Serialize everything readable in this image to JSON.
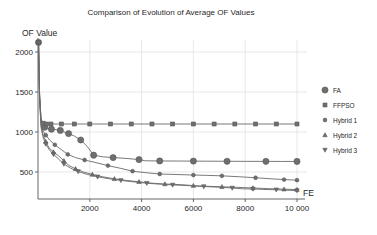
{
  "chart_data": {
    "type": "line",
    "title": "Comparison of Evolution of Average OF Values",
    "xlabel": "FE",
    "ylabel": "OF Value",
    "xlim": [
      0,
      10400
    ],
    "ylim": [
      160,
      2200
    ],
    "grid": true,
    "legend_position": "right",
    "xticks": [
      2000,
      4000,
      6000,
      8000,
      10000
    ],
    "xtick_labels": [
      "2000",
      "4000",
      "6000",
      "8000",
      "10 000"
    ],
    "yticks": [
      500,
      1000,
      1500,
      2000
    ],
    "ytick_labels": [
      "500",
      "1000",
      "1500",
      "2000"
    ],
    "series": [
      {
        "name": "FA",
        "marker": "circle-filled",
        "marker_size": 3.1,
        "color": "#6e6e6e",
        "x": [
          20,
          60,
          110,
          180,
          260,
          380,
          520,
          700,
          860,
          1000,
          1180,
          1400,
          1650,
          1900,
          2150,
          2500,
          2900,
          3400,
          3900,
          4150,
          4700,
          5400,
          6000,
          6500,
          7300,
          8000,
          8800,
          9400,
          10000
        ],
        "y": [
          2120,
          1500,
          1180,
          1090,
          1060,
          1045,
          1035,
          1030,
          1020,
          1000,
          980,
          950,
          900,
          820,
          710,
          690,
          680,
          670,
          655,
          640,
          638,
          637,
          636,
          635,
          634,
          633,
          633,
          632,
          632
        ]
      },
      {
        "name": "FFPSO",
        "marker": "square",
        "marker_size": 2.0,
        "color": "#8a8a8a",
        "x": [
          20,
          60,
          120,
          200,
          320,
          500,
          900,
          1400,
          2000,
          2800,
          3600,
          4400,
          5200,
          6000,
          6800,
          7600,
          8400,
          9200,
          10000
        ],
        "y": [
          2120,
          1480,
          1160,
          1110,
          1100,
          1100,
          1100,
          1100,
          1100,
          1100,
          1100,
          1100,
          1100,
          1100,
          1100,
          1100,
          1100,
          1100,
          1100
        ]
      },
      {
        "name": "Hybrid 1",
        "marker": "circle-small",
        "marker_size": 1.9,
        "color": "#7a7a7a",
        "x": [
          20,
          60,
          120,
          200,
          300,
          450,
          650,
          900,
          1150,
          1450,
          1800,
          2200,
          2700,
          3200,
          3650,
          4200,
          4700,
          5400,
          6000,
          6500,
          7100,
          7800,
          8400,
          9000,
          9500,
          10000
        ],
        "y": [
          2120,
          1450,
          1120,
          1010,
          960,
          900,
          840,
          780,
          720,
          680,
          650,
          620,
          580,
          545,
          510,
          490,
          475,
          468,
          462,
          458,
          452,
          440,
          428,
          415,
          405,
          398
        ]
      },
      {
        "name": "Hybrid 2",
        "marker": "triangle-up",
        "marker_size": 2.2,
        "color": "#6f6f6f",
        "x": [
          20,
          60,
          120,
          200,
          300,
          430,
          600,
          800,
          1000,
          1200,
          1450,
          1750,
          2100,
          2500,
          2950,
          3400,
          3900,
          4400,
          4900,
          5500,
          6000,
          6500,
          7100,
          7700,
          8300,
          8900,
          9500,
          10000
        ],
        "y": [
          2120,
          1420,
          1080,
          960,
          880,
          800,
          750,
          700,
          640,
          580,
          540,
          500,
          470,
          440,
          415,
          395,
          378,
          360,
          350,
          342,
          330,
          322,
          315,
          308,
          300,
          292,
          285,
          280
        ]
      },
      {
        "name": "Hybrid 3",
        "marker": "triangle-down",
        "marker_size": 2.2,
        "color": "#757575",
        "x": [
          20,
          60,
          120,
          200,
          300,
          430,
          600,
          800,
          1000,
          1250,
          1550,
          1900,
          2300,
          2750,
          3200,
          3650,
          4200,
          4700,
          5200,
          5800,
          6400,
          7000,
          7500,
          7900,
          8300,
          8700,
          9200,
          9600,
          10000
        ],
        "y": [
          2120,
          1400,
          1050,
          930,
          850,
          780,
          720,
          660,
          600,
          550,
          505,
          470,
          440,
          415,
          395,
          378,
          360,
          348,
          338,
          330,
          318,
          310,
          300,
          290,
          288,
          282,
          278,
          272,
          268
        ]
      }
    ]
  },
  "legend": {
    "items": [
      {
        "label": "FA",
        "marker": "circle-filled"
      },
      {
        "label": "FFPSO",
        "marker": "square"
      },
      {
        "label": "Hybrid 1",
        "marker": "circle-small"
      },
      {
        "label": "Hybrid 2",
        "marker": "triangle-up"
      },
      {
        "label": "Hybrid 3",
        "marker": "triangle-down"
      }
    ]
  }
}
